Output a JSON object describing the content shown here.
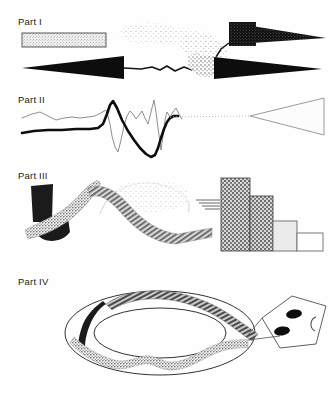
{
  "figure": {
    "background_color": "#fefefe",
    "ink_color": "#1b1b1b",
    "width": 331,
    "height": 396,
    "panels": [
      {
        "id": "part-1",
        "label": "Part I",
        "label_x": 18,
        "label_y": 16,
        "elements": [
          {
            "name": "light-gray-bar",
            "shape": "rectangle",
            "x": 22,
            "y": 33,
            "width": 84,
            "height": 14,
            "fill": "#e4e4e4",
            "stroke": "#4a4a4a",
            "pattern": "fine-stipple"
          },
          {
            "name": "stipple-cloud",
            "shape": "scatter-cloud",
            "x": 128,
            "y": 24,
            "width": 95,
            "height": 34,
            "fill": "#9a9a9a",
            "pattern": "sparse-stipple"
          },
          {
            "name": "dark-block-with-spike",
            "shape": "block-plus-taper",
            "x": 228,
            "y": 22,
            "width": 98,
            "height": 26,
            "fill": "#1b1b1b",
            "pattern": "dense-checker"
          },
          {
            "name": "left-pointing-black-arrow",
            "shape": "triangle-left",
            "x": 22,
            "y": 55,
            "width": 105,
            "height": 24,
            "fill": "#0d0d0d"
          },
          {
            "name": "jagged-connector-line",
            "shape": "polyline",
            "stroke": "#161616",
            "stroke_width": 1.6
          },
          {
            "name": "right-pointing-black-arrow",
            "shape": "triangle-right",
            "x": 212,
            "y": 57,
            "width": 108,
            "height": 22,
            "fill": "#0d0d0d"
          },
          {
            "name": "stipple-patch-left-of-arrow",
            "shape": "stipple-blob",
            "x": 196,
            "y": 52,
            "width": 30,
            "height": 28,
            "fill": "#8d8d8d"
          }
        ]
      },
      {
        "id": "part-2",
        "label": "Part II",
        "label_x": 18,
        "label_y": 94,
        "elements": [
          {
            "name": "thick-black-trace",
            "shape": "polyline",
            "stroke": "#0d0d0d",
            "stroke_width": 2.6
          },
          {
            "name": "thin-gray-trace",
            "shape": "polyline",
            "stroke": "#6e6e6e",
            "stroke_width": 0.8
          },
          {
            "name": "dotted-connector",
            "shape": "dotted-line",
            "x1": 172,
            "y1": 117,
            "x2": 248,
            "y2": 116,
            "stroke": "#b4b4b4",
            "dash": "1 2"
          },
          {
            "name": "outlined-wedge",
            "shape": "wedge-right",
            "x": 248,
            "y": 97,
            "width": 78,
            "height": 38,
            "fill": "#fbfbfb",
            "stroke": "#8a8a8a"
          }
        ]
      },
      {
        "id": "part-3",
        "label": "Part III",
        "label_x": 18,
        "label_y": 170,
        "elements": [
          {
            "name": "dark-hook-shape",
            "shape": "hook",
            "x": 30,
            "y": 182,
            "width": 46,
            "height": 58,
            "fill": "#1b1b1b"
          },
          {
            "name": "stippled-ribbon",
            "shape": "ribbon",
            "fill": "#9d9d9d",
            "pattern": "stipple"
          },
          {
            "name": "hatched-ribbon",
            "shape": "ribbon",
            "fill": "#7e7e7e",
            "pattern": "diagonal-hatch"
          },
          {
            "name": "faint-gray-arc",
            "shape": "arc",
            "stroke": "#d2d2d2"
          },
          {
            "name": "bar-chart",
            "shape": "bar-group",
            "baseline_y": 251,
            "bars": [
              {
                "name": "bar-1",
                "x": 221,
                "width": 29,
                "height": 73,
                "fill": "#bdbdbd",
                "pattern": "dense-stipple",
                "stroke": "#4a4a4a"
              },
              {
                "name": "bar-2",
                "x": 250,
                "width": 23,
                "height": 55,
                "fill": "#bdbdbd",
                "pattern": "dense-stipple",
                "stroke": "#4a4a4a"
              },
              {
                "name": "bar-3",
                "x": 273,
                "width": 24,
                "height": 30,
                "fill": "#ececec",
                "pattern": "solid",
                "stroke": "#6a6a6a"
              },
              {
                "name": "bar-4",
                "x": 297,
                "width": 26,
                "height": 18,
                "fill": "#ffffff",
                "pattern": "solid",
                "stroke": "#6a6a6a"
              }
            ]
          },
          {
            "name": "hatch-tail-to-bars",
            "shape": "hatch-lines",
            "stroke": "#555555"
          }
        ]
      },
      {
        "id": "part-4",
        "label": "Part IV",
        "label_x": 18,
        "label_y": 276,
        "elements": [
          {
            "name": "outer-ellipse",
            "shape": "ellipse",
            "cx": 160,
            "cy": 333,
            "rx": 95,
            "ry": 42,
            "fill": "none",
            "stroke": "#333333"
          },
          {
            "name": "inner-ellipse",
            "shape": "ellipse",
            "cx": 160,
            "cy": 333,
            "rx": 66,
            "ry": 25,
            "fill": "none",
            "stroke": "#333333"
          },
          {
            "name": "hatched-band-upper",
            "shape": "ribbon",
            "fill": "#808080",
            "pattern": "diagonal-hatch"
          },
          {
            "name": "stippled-band-lower",
            "shape": "ribbon",
            "fill": "#8a8a8a",
            "pattern": "stipple"
          },
          {
            "name": "kite-polygon",
            "shape": "polygon",
            "x": 262,
            "y": 296,
            "width": 64,
            "height": 54,
            "fill": "#ffffff",
            "stroke": "#4d4d4d"
          },
          {
            "name": "kite-dot-upper",
            "shape": "ellipse",
            "cx": 292,
            "cy": 314,
            "rx": 7,
            "ry": 4,
            "fill": "#0d0d0d"
          },
          {
            "name": "kite-dot-lower",
            "shape": "ellipse",
            "cx": 281,
            "cy": 330,
            "rx": 7,
            "ry": 4,
            "fill": "#0d0d0d"
          },
          {
            "name": "kite-c-arc",
            "shape": "arc",
            "cx": 310,
            "cy": 323,
            "stroke": "#4d4d4d"
          }
        ]
      }
    ]
  }
}
